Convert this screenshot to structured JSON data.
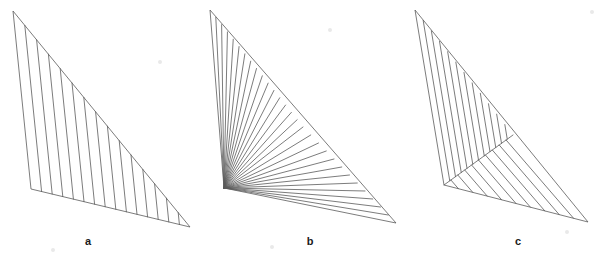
{
  "figure": {
    "canvas": {
      "width": 601,
      "height": 257,
      "background": "#ffffff"
    },
    "stroke_color": "#5a5a5a",
    "stroke_width": 0.8,
    "label_color": "#1a1a1a",
    "caption_a": "a",
    "caption_b": "b",
    "caption_c": "c",
    "panels": [
      {
        "id": "panel-a",
        "label": "a",
        "label_x": 88,
        "label_y": 241,
        "outline_name": "triangle-a-outline",
        "vertices": [
          {
            "name": "apex",
            "x": 13,
            "y": 11
          },
          {
            "name": "bottom-left",
            "x": 31,
            "y": 189
          },
          {
            "name": "bottom-right",
            "x": 190,
            "y": 227
          }
        ],
        "regions": [
          {
            "name": "region-a-vertical-hatch",
            "hatch_type": "parallel-to-left-edge",
            "from_edge": [
              [
                13,
                11
              ],
              [
                190,
                227
              ]
            ],
            "to_edge_a": [
              [
                13,
                11
              ],
              [
                31,
                189
              ]
            ],
            "to_edge_b": [
              [
                31,
                189
              ],
              [
                190,
                227
              ]
            ],
            "count": 14
          }
        ]
      },
      {
        "id": "panel-b",
        "label": "b",
        "label_x": 310,
        "label_y": 241,
        "outline_name": "triangle-b-outline",
        "vertices": [
          {
            "name": "apex",
            "x": 210,
            "y": 10
          },
          {
            "name": "bottom-left",
            "x": 224,
            "y": 188
          },
          {
            "name": "bottom-right",
            "x": 396,
            "y": 223
          }
        ],
        "interior_point": {
          "name": "split-point",
          "x": 303,
          "y": 127
        },
        "regions": [
          {
            "name": "region-b-upper-hatch",
            "hatch_type": "fan-from-bottom-left",
            "apex_point": [
              224,
              188
            ],
            "span_edge": [
              [
                210,
                10
              ],
              [
                303,
                127
              ]
            ],
            "count": 16
          },
          {
            "name": "region-b-lower-hatch",
            "hatch_type": "fan-from-bottom-left-lower",
            "apex_point": [
              224,
              188
            ],
            "span_edge": [
              [
                303,
                127
              ],
              [
                396,
                223
              ]
            ],
            "count": 12
          }
        ],
        "divider": {
          "name": "divider-b",
          "from": [
            224,
            188
          ],
          "to": [
            303,
            127
          ]
        }
      },
      {
        "id": "panel-c",
        "label": "c",
        "label_x": 518,
        "label_y": 241,
        "outline_name": "triangle-c-outline",
        "vertices": [
          {
            "name": "apex",
            "x": 415,
            "y": 10
          },
          {
            "name": "bottom-left",
            "x": 444,
            "y": 185
          },
          {
            "name": "bottom-right",
            "x": 588,
            "y": 222
          }
        ],
        "split_point": {
          "name": "split-point-c",
          "x": 513,
          "y": 135
        },
        "regions": [
          {
            "name": "region-c-upper-hatch",
            "hatch_type": "parallel-to-left-edge",
            "from_edge": [
              [
                415,
                10
              ],
              [
                513,
                135
              ]
            ],
            "to_edge_a": [
              [
                415,
                10
              ],
              [
                444,
                185
              ]
            ],
            "to_edge_b": [
              [
                444,
                185
              ],
              [
                513,
                135
              ]
            ],
            "count": 11
          },
          {
            "name": "region-c-lower-hatch",
            "hatch_type": "parallel-to-bottom-edge",
            "from_edge": [
              [
                513,
                135
              ],
              [
                588,
                222
              ]
            ],
            "to_edge_a": [
              [
                444,
                185
              ],
              [
                513,
                135
              ]
            ],
            "to_edge_b": [
              [
                444,
                185
              ],
              [
                588,
                222
              ]
            ],
            "count": 9
          }
        ],
        "divider": {
          "name": "divider-c",
          "from": [
            444,
            185
          ],
          "to": [
            513,
            135
          ]
        }
      }
    ],
    "specks": [
      {
        "x": 160,
        "y": 62,
        "r": 2
      },
      {
        "x": 330,
        "y": 30,
        "r": 2
      },
      {
        "x": 272,
        "y": 247,
        "r": 2
      },
      {
        "x": 567,
        "y": 232,
        "r": 2
      },
      {
        "x": 592,
        "y": 12,
        "r": 2
      },
      {
        "x": 53,
        "y": 250,
        "r": 2
      }
    ]
  }
}
